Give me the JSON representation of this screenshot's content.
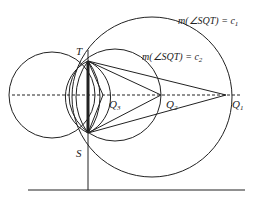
{
  "figure": {
    "labels": {
      "T": "T",
      "S": "S",
      "Q1": "Q",
      "Q1_sub": "1",
      "Q2": "Q",
      "Q2_sub": "2",
      "Q3": "Q",
      "Q3_sub": "3"
    },
    "annotations": {
      "c1": "m(∠SQT) = c",
      "c1_sub": "1",
      "c2": "m(∠SQT) = c",
      "c2_sub": "2"
    },
    "colors": {
      "stroke": "#222222",
      "background": "#ffffff"
    }
  }
}
